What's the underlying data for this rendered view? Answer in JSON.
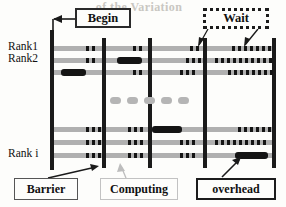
{
  "figure": {
    "kind": "mpi-barrier-timeline",
    "rank_labels": [
      {
        "text": "Rank1",
        "x": 8,
        "y": 42
      },
      {
        "text": "Rank2",
        "x": 8,
        "y": 54
      },
      {
        "text": "Rank i",
        "x": 8,
        "y": 150
      }
    ],
    "callouts": {
      "begin": {
        "label": "Begin",
        "x": 75,
        "y": 8,
        "w": 56,
        "h": 20
      },
      "wait": {
        "label": "Wait",
        "x": 203,
        "y": 8,
        "w": 66,
        "h": 21
      },
      "barrier": {
        "label": "Barrier",
        "x": 14,
        "y": 178,
        "w": 64,
        "h": 22
      },
      "computing": {
        "label": "Computing",
        "x": 100,
        "y": 178,
        "w": 78,
        "h": 22
      },
      "overhead": {
        "label": "overhead",
        "x": 196,
        "y": 178,
        "w": 80,
        "h": 22
      }
    },
    "colors": {
      "timeline": "#b0b0b0",
      "barrier": "#1a1a1a",
      "overhead": "#141414",
      "wait_dots": "#141414",
      "ellipsis": "#b5b5b5",
      "background": "#fdfdfb",
      "bleed_text": "#c9c7c2"
    },
    "axis": {
      "x_start": 50,
      "x_end": 276,
      "note": "time increases to the right"
    },
    "barriers": [
      {
        "name": "barrier-0",
        "x": 50,
        "y": 30,
        "h": 140
      },
      {
        "name": "barrier-1",
        "x": 102,
        "y": 38,
        "h": 130
      },
      {
        "name": "barrier-2",
        "x": 148,
        "y": 38,
        "h": 130
      },
      {
        "name": "barrier-3",
        "x": 203,
        "y": 38,
        "h": 130
      },
      {
        "name": "barrier-4",
        "x": 272,
        "y": 38,
        "h": 130
      }
    ],
    "rows": [
      {
        "name": "rank1",
        "y": 46,
        "x": 50,
        "w": 226
      },
      {
        "name": "rank2",
        "y": 58,
        "x": 50,
        "w": 226
      },
      {
        "name": "rank3",
        "y": 70,
        "x": 50,
        "w": 226
      },
      {
        "name": "rank-n2",
        "y": 127,
        "x": 50,
        "w": 226
      },
      {
        "name": "rank-n1",
        "y": 140,
        "x": 50,
        "w": 226
      },
      {
        "name": "rank-i",
        "y": 153,
        "x": 50,
        "w": 226
      }
    ],
    "overhead_bars": [
      {
        "row": "rank2",
        "x": 117,
        "y": 57,
        "w": 25
      },
      {
        "row": "rank3",
        "x": 61,
        "y": 69,
        "w": 25
      },
      {
        "row": "rank-n2",
        "x": 152,
        "y": 126,
        "w": 30
      },
      {
        "row": "rank-i",
        "x": 235,
        "y": 152,
        "w": 33
      }
    ],
    "wait_segments": [
      {
        "row": "rank1",
        "x": 86,
        "y": 46,
        "count": 2,
        "step": 6
      },
      {
        "row": "rank1",
        "x": 133,
        "y": 46,
        "count": 2,
        "step": 6
      },
      {
        "row": "rank1",
        "x": 190,
        "y": 46,
        "count": 2,
        "step": 6
      },
      {
        "row": "rank1",
        "x": 232,
        "y": 46,
        "count": 7,
        "step": 6
      },
      {
        "row": "rank2",
        "x": 86,
        "y": 58,
        "count": 2,
        "step": 6
      },
      {
        "row": "rank2",
        "x": 186,
        "y": 58,
        "count": 3,
        "step": 6
      },
      {
        "row": "rank2",
        "x": 215,
        "y": 58,
        "count": 10,
        "step": 6
      },
      {
        "row": "rank3",
        "x": 133,
        "y": 70,
        "count": 2,
        "step": 6
      },
      {
        "row": "rank3",
        "x": 180,
        "y": 70,
        "count": 3,
        "step": 6
      },
      {
        "row": "rank3",
        "x": 228,
        "y": 70,
        "count": 8,
        "step": 6
      },
      {
        "row": "rank-n2",
        "x": 86,
        "y": 127,
        "count": 3,
        "step": 6
      },
      {
        "row": "rank-n2",
        "x": 128,
        "y": 127,
        "count": 3,
        "step": 6
      },
      {
        "row": "rank-n2",
        "x": 238,
        "y": 127,
        "count": 6,
        "step": 6
      },
      {
        "row": "rank-n1",
        "x": 86,
        "y": 140,
        "count": 3,
        "step": 6
      },
      {
        "row": "rank-n1",
        "x": 128,
        "y": 140,
        "count": 3,
        "step": 6
      },
      {
        "row": "rank-n1",
        "x": 180,
        "y": 140,
        "count": 3,
        "step": 6
      },
      {
        "row": "rank-n1",
        "x": 215,
        "y": 140,
        "count": 9,
        "step": 6
      },
      {
        "row": "rank-i",
        "x": 86,
        "y": 153,
        "count": 3,
        "step": 6
      },
      {
        "row": "rank-i",
        "x": 128,
        "y": 153,
        "count": 3,
        "step": 6
      },
      {
        "row": "rank-i",
        "x": 180,
        "y": 153,
        "count": 3,
        "step": 6
      }
    ],
    "ellipsis_rows": [
      {
        "name": "vertical-ellipsis",
        "x": 110,
        "y": 97,
        "count": 5,
        "step": 17
      }
    ],
    "background_text": [
      {
        "text": "\u0001 of the Variation",
        "x": 100,
        "y": 2,
        "size": 12
      },
      {
        "text": "f",
        "x": 268,
        "y": 62,
        "size": 12
      },
      {
        "text": "e",
        "x": 4,
        "y": 78,
        "size": 12
      },
      {
        "text": "t",
        "x": 4,
        "y": 110,
        "size": 12
      },
      {
        "text": "e",
        "x": 4,
        "y": 126,
        "size": 12
      }
    ]
  }
}
